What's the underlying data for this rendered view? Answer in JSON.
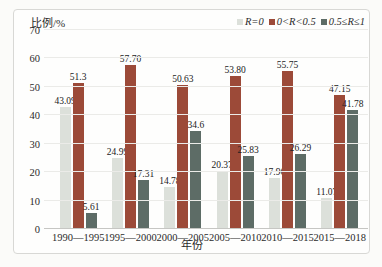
{
  "chart_data": {
    "type": "bar",
    "title": "",
    "ylabel": "比例/%",
    "xlabel": "年份",
    "ylim": [
      0,
      70
    ],
    "yticks": [
      0,
      10,
      20,
      30,
      40,
      50,
      60,
      70
    ],
    "grid": true,
    "legend_position": "top-right",
    "categories": [
      "1990—1995",
      "1995—2000",
      "2000—2005",
      "2005—2010",
      "2010—2015",
      "2015—2018"
    ],
    "series": [
      {
        "name": "R=0",
        "color": "#dce0da",
        "values": [
          43.09,
          24.99,
          14.78,
          20.37,
          17.96,
          11.07
        ],
        "labels": [
          "43.09",
          "24.99",
          "14.78",
          "20.37",
          "17.96",
          "11.07"
        ]
      },
      {
        "name": "0<R<0.5",
        "color": "#9c4a38",
        "values": [
          51.3,
          57.7,
          50.63,
          53.8,
          55.75,
          47.15
        ],
        "labels": [
          "51.3",
          "57.70",
          "50.63",
          "53.80",
          "55.75",
          "47.15"
        ]
      },
      {
        "name": "0.5≤R≤1",
        "color": "#5d6c66",
        "values": [
          5.61,
          17.31,
          34.6,
          25.83,
          26.29,
          41.78
        ],
        "labels": [
          "5.61",
          "17.31",
          "34.6",
          "25.83",
          "26.29",
          "41.78"
        ]
      }
    ]
  }
}
